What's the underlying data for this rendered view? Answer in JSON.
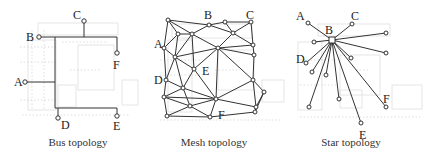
{
  "panels": [
    {
      "id": "bus",
      "caption": "Bus topology",
      "labels": [
        {
          "text": "A",
          "x": 14,
          "y": 86
        },
        {
          "text": "B",
          "x": 25,
          "y": 40
        },
        {
          "text": "C",
          "x": 74,
          "y": 19
        },
        {
          "text": "D",
          "x": 61,
          "y": 129
        },
        {
          "text": "E",
          "x": 113,
          "y": 130
        },
        {
          "text": "F",
          "x": 113,
          "y": 69
        }
      ]
    },
    {
      "id": "mesh",
      "caption": "Mesh topology",
      "labels": [
        {
          "text": "A",
          "x": 154,
          "y": 48
        },
        {
          "text": "B",
          "x": 204,
          "y": 19
        },
        {
          "text": "C",
          "x": 246,
          "y": 19
        },
        {
          "text": "D",
          "x": 154,
          "y": 85
        },
        {
          "text": "E",
          "x": 202,
          "y": 75
        },
        {
          "text": "F",
          "x": 218,
          "y": 118
        }
      ]
    },
    {
      "id": "star",
      "caption": "Star topology",
      "labels": [
        {
          "text": "A",
          "x": 296,
          "y": 20
        },
        {
          "text": "B",
          "x": 325,
          "y": 34
        },
        {
          "text": "C",
          "x": 351,
          "y": 20
        },
        {
          "text": "D",
          "x": 296,
          "y": 63
        },
        {
          "text": "E",
          "x": 359,
          "y": 139
        },
        {
          "text": "F",
          "x": 383,
          "y": 103
        }
      ]
    }
  ]
}
